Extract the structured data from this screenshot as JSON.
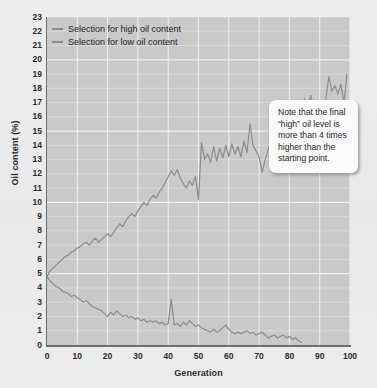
{
  "chart_data": {
    "type": "line",
    "title": "",
    "xlabel": "Generation",
    "ylabel": "Oil content (%)",
    "xlim": [
      0,
      100
    ],
    "ylim": [
      0,
      23
    ],
    "xticks": [
      0,
      10,
      20,
      30,
      40,
      50,
      60,
      70,
      80,
      90,
      100
    ],
    "yticks": [
      0,
      1,
      2,
      3,
      4,
      5,
      6,
      7,
      8,
      9,
      10,
      11,
      12,
      13,
      14,
      15,
      16,
      17,
      18,
      19,
      20,
      21,
      22,
      23
    ],
    "grid": true,
    "legend_position": "top-left",
    "line_color": "#8d8d8d",
    "plot_background": "#c9c9c9",
    "gridline_color": "#f2f2f2",
    "series": [
      {
        "name": "Selection for high oil content",
        "x": [
          0,
          1,
          2,
          3,
          4,
          5,
          6,
          7,
          8,
          9,
          10,
          11,
          12,
          13,
          14,
          15,
          16,
          17,
          18,
          19,
          20,
          21,
          22,
          23,
          24,
          25,
          26,
          27,
          28,
          29,
          30,
          31,
          32,
          33,
          34,
          35,
          36,
          37,
          38,
          39,
          40,
          41,
          42,
          43,
          44,
          45,
          46,
          47,
          48,
          49,
          50,
          51,
          52,
          53,
          54,
          55,
          56,
          57,
          58,
          59,
          60,
          61,
          62,
          63,
          64,
          65,
          66,
          67,
          68,
          69,
          70,
          71,
          72,
          73,
          74,
          75,
          76,
          77,
          78,
          79,
          80,
          81,
          82,
          83,
          84,
          85,
          86,
          87,
          88,
          89,
          90,
          91,
          92,
          93,
          94,
          95,
          96,
          97,
          98,
          99
        ],
        "values": [
          4.8,
          5.2,
          5.4,
          5.6,
          5.8,
          6.0,
          6.2,
          6.3,
          6.5,
          6.6,
          6.8,
          6.9,
          7.1,
          7.2,
          7.0,
          7.3,
          7.5,
          7.2,
          7.4,
          7.6,
          7.8,
          7.6,
          7.9,
          8.2,
          8.5,
          8.3,
          8.7,
          9.0,
          9.2,
          9.0,
          9.4,
          9.7,
          10.0,
          9.8,
          10.2,
          10.5,
          10.3,
          10.7,
          11.0,
          11.4,
          11.8,
          12.2,
          11.9,
          12.3,
          11.7,
          11.3,
          11.0,
          11.5,
          11.2,
          11.8,
          10.2,
          14.2,
          13.0,
          13.4,
          12.8,
          13.9,
          12.9,
          13.8,
          13.1,
          14.0,
          13.2,
          14.1,
          13.4,
          13.9,
          13.2,
          14.3,
          13.5,
          15.5,
          14.0,
          13.6,
          13.2,
          12.1,
          13.0,
          13.7,
          14.4,
          14.5,
          15.0,
          14.8,
          15.3,
          15.1,
          15.6,
          15.4,
          16.0,
          16.8,
          15.9,
          17.3,
          16.4,
          17.5,
          16.6,
          17.0,
          16.3,
          16.9,
          17.2,
          18.8,
          17.8,
          18.2,
          17.6,
          18.3,
          17.0,
          19.0
        ],
        "peak_value": 22.8,
        "peak_generation": 92,
        "final_value": 20.6,
        "start_value": 4.8
      },
      {
        "name": "Selection for low oil content",
        "x": [
          0,
          1,
          2,
          3,
          4,
          5,
          6,
          7,
          8,
          9,
          10,
          11,
          12,
          13,
          14,
          15,
          16,
          17,
          18,
          19,
          20,
          21,
          22,
          23,
          24,
          25,
          26,
          27,
          28,
          29,
          30,
          31,
          32,
          33,
          34,
          35,
          36,
          37,
          38,
          39,
          40,
          41,
          42,
          43,
          44,
          45,
          46,
          47,
          48,
          49,
          50,
          51,
          52,
          53,
          54,
          55,
          56,
          57,
          58,
          59,
          60,
          61,
          62,
          63,
          64,
          65,
          66,
          67,
          68,
          69,
          70,
          71,
          72,
          73,
          74,
          75,
          76,
          77,
          78,
          79,
          80,
          81,
          82,
          83,
          84
        ],
        "values": [
          4.8,
          4.5,
          4.3,
          4.1,
          4.0,
          3.8,
          3.7,
          3.6,
          3.4,
          3.5,
          3.3,
          3.2,
          3.0,
          3.1,
          2.9,
          2.7,
          2.6,
          2.5,
          2.4,
          2.2,
          2.0,
          2.3,
          2.1,
          2.4,
          2.2,
          2.0,
          2.1,
          1.9,
          2.0,
          1.8,
          1.9,
          1.7,
          1.8,
          1.6,
          1.7,
          1.6,
          1.7,
          1.5,
          1.6,
          1.4,
          1.5,
          3.2,
          1.4,
          1.5,
          1.3,
          1.6,
          1.4,
          1.7,
          1.5,
          1.3,
          1.4,
          1.2,
          1.1,
          1.0,
          0.9,
          1.1,
          0.9,
          1.0,
          1.2,
          1.4,
          1.1,
          0.9,
          0.8,
          0.9,
          0.8,
          0.9,
          1.0,
          0.8,
          0.9,
          0.7,
          0.8,
          0.9,
          0.7,
          0.5,
          0.6,
          0.7,
          0.5,
          0.6,
          0.7,
          0.5,
          0.6,
          0.4,
          0.5,
          0.3,
          0.2
        ],
        "spike_value": 3.2,
        "spike_generation": 41,
        "final_value": 0.2,
        "start_value": 4.8
      }
    ]
  },
  "legend": {
    "items": [
      {
        "label": "Selection for high oil content"
      },
      {
        "label": "Selection for low oil content"
      }
    ]
  },
  "annotation": {
    "note_text": "Note that the final “high” oil level is more than 4 times higher than the starting point."
  }
}
